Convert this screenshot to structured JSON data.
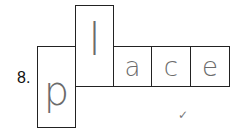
{
  "question": {
    "number_label": "8.",
    "word": "place",
    "letters": [
      {
        "char": "p",
        "box": "tall-descender"
      },
      {
        "char": "l",
        "box": "tall-ascender"
      },
      {
        "char": "a",
        "box": "short"
      },
      {
        "char": "c",
        "box": "short"
      },
      {
        "char": "e",
        "box": "short"
      }
    ],
    "mark": "✓"
  }
}
